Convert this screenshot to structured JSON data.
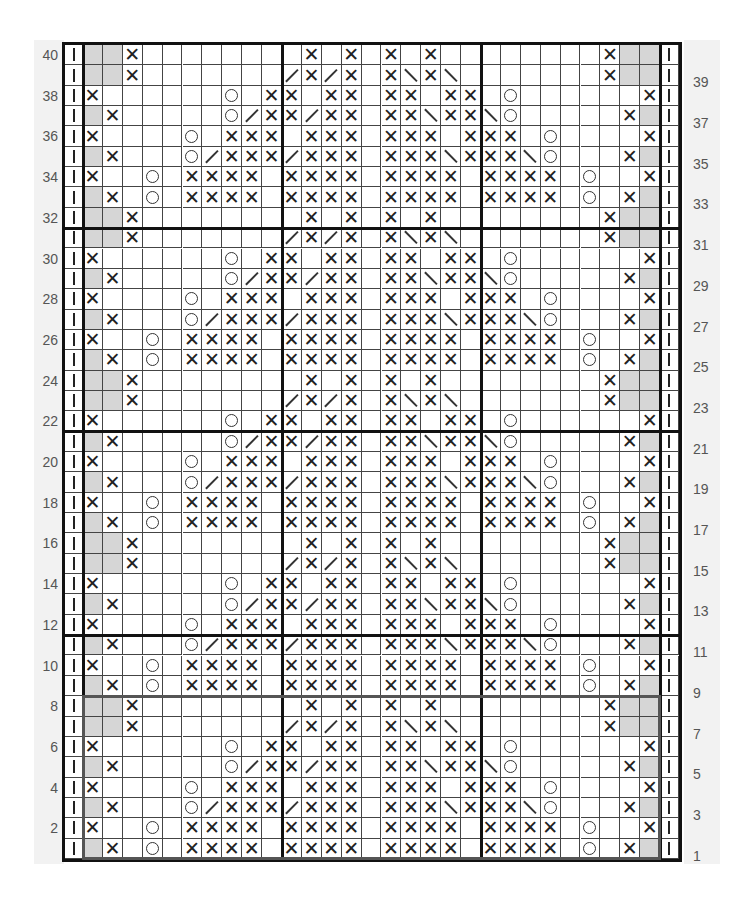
{
  "chart": {
    "title": "",
    "columns": 31,
    "rows": 40,
    "colors": {
      "grid": "#444444",
      "border": "#111111",
      "shaded": "#d6d6d6",
      "repeat_box": "#555555",
      "label_panel": "#f2f2f2",
      "label_text": "#555555"
    },
    "symbols": {
      "I": "bar",
      "X": "x",
      "O": "circle",
      "/": "slash",
      "\\": "backslash",
      "S": "shaded",
      "_": "blank"
    },
    "row_patterns": {
      "A": "I|X______O_X|X_XX_XX_XX|_O______X|I",
      "B": "I|SX_____O/X|X/XX_XX\\XX|\\O_____XS|I",
      "C": "I|X____O_XXX|_XXX_XXX_X|XX_O____X|I",
      "D": "I|SX___O/XXX|/XXX_XXX\\X|XX\\O___XS|I",
      "E": "I|X__O_XXXX_|XXXX_XXXX_|XXXX_O__X|I",
      "F": "I|SX_O_XXXX_|XXXX_XXXX_|XXXX_O_XS|I",
      "G": "I|SSX_______|_X_X_X_X__|______XSS|I",
      "H": "I|SSX_______|/X/X_X\\X\\_|______XSS|I"
    },
    "row_sequence_top_to_bottom": [
      {
        "row": 40,
        "pattern": "G"
      },
      {
        "row": 39,
        "pattern": "H"
      },
      {
        "row": 38,
        "pattern": "A"
      },
      {
        "row": 37,
        "pattern": "B"
      },
      {
        "row": 36,
        "pattern": "C"
      },
      {
        "row": 35,
        "pattern": "D"
      },
      {
        "row": 34,
        "pattern": "E"
      },
      {
        "row": 33,
        "pattern": "F"
      },
      {
        "row": 32,
        "pattern": "G"
      },
      {
        "row": 31,
        "pattern": "H"
      },
      {
        "row": 30,
        "pattern": "A"
      },
      {
        "row": 29,
        "pattern": "B"
      },
      {
        "row": 28,
        "pattern": "C"
      },
      {
        "row": 27,
        "pattern": "D"
      },
      {
        "row": 26,
        "pattern": "E"
      },
      {
        "row": 25,
        "pattern": "F"
      },
      {
        "row": 24,
        "pattern": "G"
      },
      {
        "row": 23,
        "pattern": "H"
      },
      {
        "row": 22,
        "pattern": "A"
      },
      {
        "row": 21,
        "pattern": "B"
      },
      {
        "row": 20,
        "pattern": "C"
      },
      {
        "row": 19,
        "pattern": "D"
      },
      {
        "row": 18,
        "pattern": "E"
      },
      {
        "row": 17,
        "pattern": "F"
      },
      {
        "row": 16,
        "pattern": "G"
      },
      {
        "row": 15,
        "pattern": "H"
      },
      {
        "row": 14,
        "pattern": "A"
      },
      {
        "row": 13,
        "pattern": "B"
      },
      {
        "row": 12,
        "pattern": "C"
      },
      {
        "row": 11,
        "pattern": "D"
      },
      {
        "row": 10,
        "pattern": "E"
      },
      {
        "row": 9,
        "pattern": "F"
      },
      {
        "row": 8,
        "pattern": "G"
      },
      {
        "row": 7,
        "pattern": "H"
      },
      {
        "row": 6,
        "pattern": "A"
      },
      {
        "row": 5,
        "pattern": "B"
      },
      {
        "row": 4,
        "pattern": "C"
      },
      {
        "row": 3,
        "pattern": "D"
      },
      {
        "row": 2,
        "pattern": "E"
      },
      {
        "row": 1,
        "pattern": "F"
      }
    ],
    "left_row_labels": [
      "40",
      "38",
      "36",
      "34",
      "32",
      "30",
      "28",
      "26",
      "24",
      "22",
      "20",
      "18",
      "16",
      "14",
      "12",
      "10",
      "8",
      "6",
      "4",
      "2"
    ],
    "right_row_labels": [
      "39",
      "37",
      "35",
      "33",
      "31",
      "29",
      "27",
      "25",
      "23",
      "21",
      "19",
      "17",
      "15",
      "13",
      "11",
      "9",
      "7",
      "5",
      "3",
      "1"
    ],
    "thick_row_dividers_below_rows": [
      31,
      21,
      11
    ],
    "thick_col_dividers_after_cols": [
      1,
      11,
      21,
      30
    ],
    "repeat_box": {
      "from_row": 1,
      "to_row": 8,
      "from_col": 2,
      "to_col": 30
    }
  }
}
